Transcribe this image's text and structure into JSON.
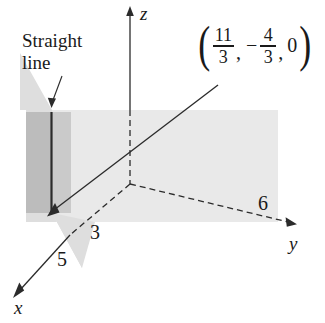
{
  "figure": {
    "type": "3d-coordinate-diagram",
    "background_color": "#ffffff",
    "ink_color": "#1a1a1a"
  },
  "axes": {
    "x": {
      "label": "x",
      "style": "dashed-then-solid-with-arrow"
    },
    "y": {
      "label": "y",
      "style": "dashed-with-arrow"
    },
    "z": {
      "label": "z",
      "style": "dashed-then-solid-with-arrow"
    }
  },
  "annotations": {
    "straight_line_note": {
      "line1": "Straight",
      "line2": "line"
    },
    "x_intercept_inner": "3",
    "x_intercept_outer": "5",
    "y_intercept": "6"
  },
  "point_label": {
    "open_paren": "(",
    "x_numerator": "11",
    "x_denominator": "3",
    "comma_1": ",",
    "minus_sign": "−",
    "y_numerator": "4",
    "y_denominator": "3",
    "comma_2": ",",
    "z_value": "0",
    "close_paren": ")"
  },
  "shapes": {
    "horizontal_plane_color": "#e9e9e9",
    "vertical_plane_light_color": "#dedede",
    "vertical_plane_dark_color": "#bcbcbc",
    "line_color": "#2b2b2b"
  }
}
